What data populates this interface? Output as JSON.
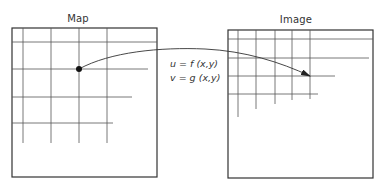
{
  "diagram": {
    "left_panel": {
      "title": "Map",
      "box": {
        "x": 12,
        "y": 28,
        "w": 145,
        "h": 149
      },
      "vertical_lines": [
        {
          "x": 23,
          "y1": 28,
          "y2": 143
        },
        {
          "x": 51,
          "y1": 28,
          "y2": 143
        },
        {
          "x": 79,
          "y1": 28,
          "y2": 143
        },
        {
          "x": 107,
          "y1": 28,
          "y2": 143
        }
      ],
      "horizontal_lines": [
        {
          "y": 42,
          "x1": 12,
          "x2": 157
        },
        {
          "y": 69,
          "x1": 12,
          "x2": 148
        },
        {
          "y": 97,
          "x1": 12,
          "x2": 132
        },
        {
          "y": 123,
          "x1": 12,
          "x2": 113
        }
      ],
      "point": {
        "x": 79,
        "y": 69
      }
    },
    "right_panel": {
      "title": "Image",
      "box": {
        "x": 228,
        "y": 30,
        "w": 145,
        "h": 148
      },
      "vertical_lines": [
        {
          "x": 238,
          "y1": 30,
          "y2": 117
        },
        {
          "x": 256,
          "y1": 30,
          "y2": 109
        },
        {
          "x": 275,
          "y1": 30,
          "y2": 104
        },
        {
          "x": 292,
          "y1": 30,
          "y2": 100
        },
        {
          "x": 310,
          "y1": 30,
          "y2": 99
        }
      ],
      "horizontal_lines": [
        {
          "y": 39,
          "x1": 228,
          "x2": 373
        },
        {
          "y": 58,
          "x1": 228,
          "x2": 369
        },
        {
          "y": 76,
          "x1": 228,
          "x2": 335
        },
        {
          "y": 94,
          "x1": 228,
          "x2": 318
        }
      ],
      "arrow_target": {
        "x": 310,
        "y": 76
      }
    },
    "mapping": {
      "equation_u": "u = f (x,y)",
      "equation_v": "v = g (x,y)"
    },
    "colors": {
      "line": "#333333",
      "grid": "#555555",
      "background": "#ffffff"
    }
  }
}
